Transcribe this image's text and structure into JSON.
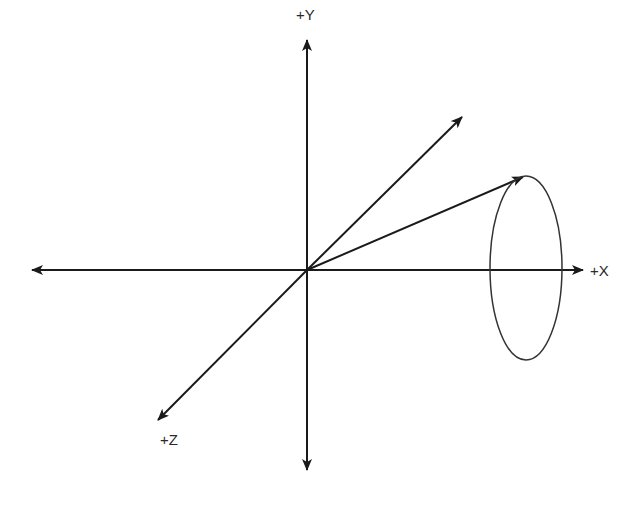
{
  "diagram": {
    "type": "3d-coordinate-axes",
    "origin": {
      "x": 307,
      "y": 270
    },
    "colors": {
      "stroke": "#1a1a1a",
      "label": "#2a2a2a",
      "background": "#ffffff"
    },
    "axes": [
      {
        "id": "y",
        "label": "+Y",
        "from": [
          307,
          470
        ],
        "to": [
          307,
          40
        ],
        "bidirectional": true
      },
      {
        "id": "x",
        "label": "+X",
        "from": [
          32,
          270
        ],
        "to": [
          583,
          270
        ],
        "bidirectional": true
      },
      {
        "id": "z",
        "label": "+Z",
        "from": [
          307,
          270
        ],
        "to": [
          158,
          420
        ],
        "bidirectional": false
      }
    ],
    "vectors": [
      {
        "id": "vector-diagonal",
        "from": [
          307,
          270
        ],
        "to": [
          462,
          117
        ]
      },
      {
        "id": "vector-to-ellipse",
        "from": [
          307,
          270
        ],
        "to": [
          523,
          177
        ]
      }
    ],
    "ellipse": {
      "cx": 526,
      "cy": 268,
      "rx": 36,
      "ry": 92
    },
    "labels": {
      "y": {
        "text": "+Y",
        "x": 296,
        "y": 20
      },
      "x": {
        "text": "+X",
        "x": 590,
        "y": 276
      },
      "z": {
        "text": "+Z",
        "x": 160,
        "y": 445
      }
    }
  }
}
